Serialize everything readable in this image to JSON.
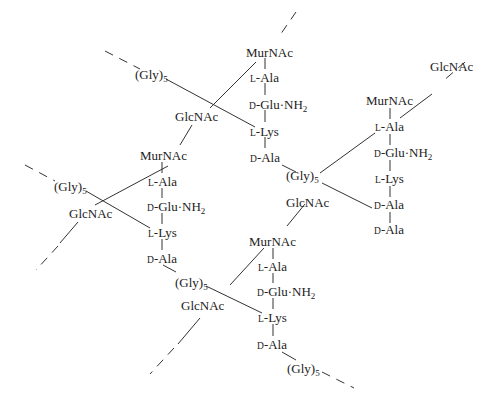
{
  "diagram": {
    "type": "peptidoglycan-structure",
    "labels": {
      "murnac": "MurNAc",
      "glcnac": "GlcNAc",
      "gly": "(Gly)",
      "gly_sub": "5",
      "l_prefix": "L",
      "d_prefix": "D",
      "ala": "-Ala",
      "lys": "-Lys",
      "glu": "-Glu·NH",
      "glu_sub": "2"
    },
    "units": [
      {
        "id": "top",
        "chain": [
          "MurNAc",
          "L-Ala",
          "D-Glu·NH2",
          "L-Lys",
          "D-Ala"
        ]
      },
      {
        "id": "left",
        "chain": [
          "MurNAc",
          "L-Ala",
          "D-Glu·NH2",
          "L-Lys",
          "D-Ala"
        ]
      },
      {
        "id": "right",
        "chain": [
          "GlcNAc",
          "MurNAc",
          "L-Ala",
          "D-Glu·NH2",
          "L-Lys",
          "D-Ala",
          "D-Ala"
        ]
      },
      {
        "id": "bottom",
        "chain": [
          "MurNAc",
          "L-Ala",
          "D-Glu·NH2",
          "L-Lys",
          "D-Ala"
        ]
      }
    ],
    "crosslinks": [
      "(Gly)5",
      "(Gly)5",
      "(Gly)5",
      "(Gly)5",
      "(Gly)5"
    ]
  }
}
